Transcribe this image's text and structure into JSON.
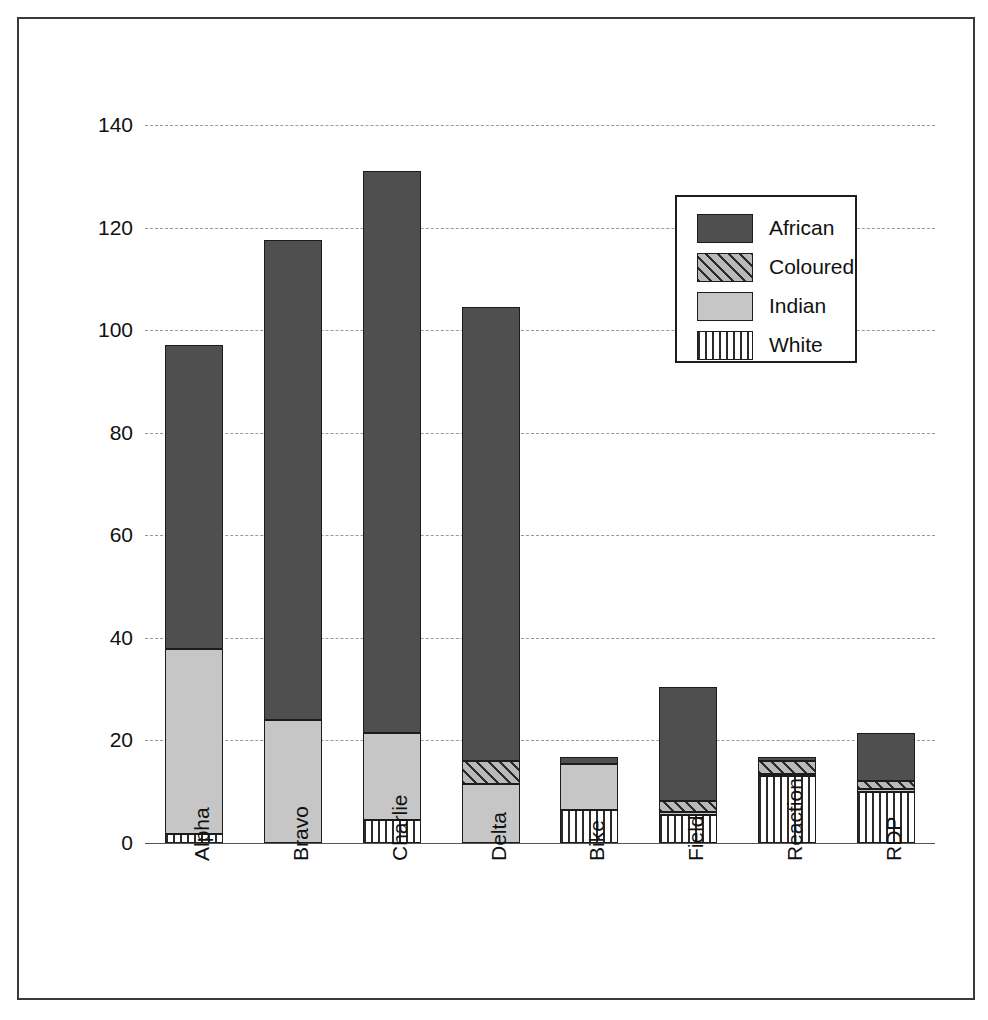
{
  "chart_data": {
    "type": "bar",
    "subtype": "stacked-bar",
    "title": "",
    "xlabel": "",
    "ylabel": "",
    "ylim": [
      0,
      140
    ],
    "yticks": [
      0,
      20,
      40,
      60,
      80,
      100,
      120,
      140
    ],
    "grid": true,
    "grid_style": "dashed-horizontal",
    "legend_position": "upper-right-inside",
    "categories": [
      "Alpha",
      "Bravo",
      "Charlie",
      "Delta",
      "Bike",
      "Field",
      "Reaction",
      "RDP"
    ],
    "series": [
      {
        "name": "White",
        "values": [
          1.8,
          0.0,
          4.5,
          0.0,
          6.5,
          5.5,
          13.0,
          10.0
        ]
      },
      {
        "name": "Indian",
        "values": [
          36.0,
          24.0,
          17.0,
          11.5,
          9.0,
          0.6,
          0.5,
          0.6
        ]
      },
      {
        "name": "Coloured",
        "values": [
          0.0,
          0.0,
          0.0,
          4.5,
          0.0,
          2.0,
          2.5,
          1.5
        ]
      },
      {
        "name": "African",
        "values": [
          59.4,
          93.5,
          109.5,
          88.5,
          1.2,
          22.4,
          0.7,
          9.4
        ]
      }
    ],
    "stack_order": [
      "White",
      "Indian",
      "Coloured",
      "African"
    ],
    "totals": [
      97.2,
      117.5,
      131.0,
      104.5,
      16.7,
      30.5,
      16.7,
      21.5
    ],
    "legend": [
      {
        "label": "African",
        "pattern": "solid-dark-gray",
        "color": "#4f4f4f"
      },
      {
        "label": "Coloured",
        "pattern": "diagonal-hatch",
        "color": "#b9b9b9"
      },
      {
        "label": "Indian",
        "pattern": "solid-light-gray",
        "color": "#c6c6c6"
      },
      {
        "label": "White",
        "pattern": "vertical-stripes",
        "color": "#ffffff"
      }
    ]
  },
  "axis": {
    "y_tick_labels": [
      "140",
      "120",
      "100",
      "80",
      "60",
      "40",
      "20",
      "0"
    ],
    "x_tick_labels": [
      "Alpha",
      "Bravo",
      "Charlie",
      "Delta",
      "Bike",
      "Field",
      "Reaction",
      "RDP"
    ]
  },
  "legend": {
    "items": [
      {
        "label": "African"
      },
      {
        "label": "Coloured"
      },
      {
        "label": "Indian"
      },
      {
        "label": "White"
      }
    ]
  }
}
